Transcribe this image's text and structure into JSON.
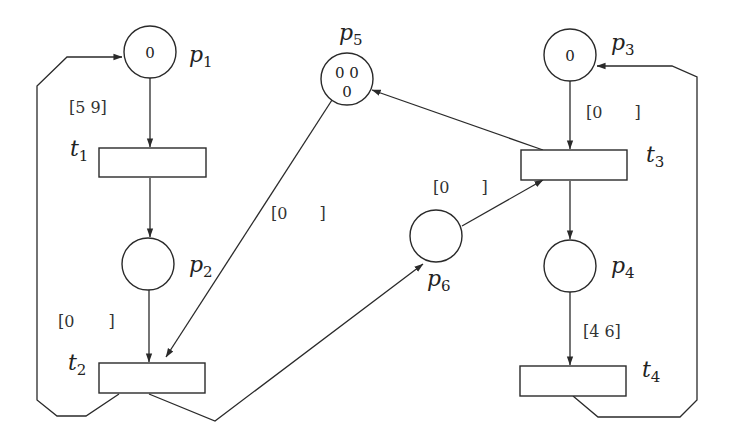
{
  "diagram": {
    "type": "petri-net",
    "places": [
      {
        "id": "p1",
        "label": "p",
        "sub": "1",
        "tokens": [
          "0"
        ]
      },
      {
        "id": "p2",
        "label": "p",
        "sub": "2",
        "tokens": []
      },
      {
        "id": "p3",
        "label": "p",
        "sub": "3",
        "tokens": [
          "0"
        ]
      },
      {
        "id": "p4",
        "label": "p",
        "sub": "4",
        "tokens": []
      },
      {
        "id": "p5",
        "label": "p",
        "sub": "5",
        "tokens": [
          "0 0",
          "0"
        ]
      },
      {
        "id": "p6",
        "label": "p",
        "sub": "6",
        "tokens": []
      }
    ],
    "transitions": [
      {
        "id": "t1",
        "label": "t",
        "sub": "1",
        "interval": {
          "open": "[5",
          "close": "9]"
        }
      },
      {
        "id": "t2",
        "label": "t",
        "sub": "2",
        "interval": {
          "open": "[0",
          "close": "]"
        }
      },
      {
        "id": "t3",
        "label": "t",
        "sub": "3",
        "interval": {
          "open": "[0",
          "close": "]"
        }
      },
      {
        "id": "t4",
        "label": "t",
        "sub": "4",
        "interval": {
          "open": "[4",
          "close": "6]"
        }
      }
    ],
    "arc_intervals": [
      {
        "id": "p5-t2",
        "open": "[0",
        "close": "]"
      },
      {
        "id": "p6-t3",
        "open": "[0",
        "close": "]"
      }
    ],
    "arcs": [
      {
        "from": "p1",
        "to": "t1"
      },
      {
        "from": "t1",
        "to": "p2"
      },
      {
        "from": "p2",
        "to": "t2"
      },
      {
        "from": "t2",
        "to": "p1"
      },
      {
        "from": "p5",
        "to": "t2"
      },
      {
        "from": "t2",
        "to": "p6"
      },
      {
        "from": "p6",
        "to": "t3"
      },
      {
        "from": "p3",
        "to": "t3"
      },
      {
        "from": "t3",
        "to": "p5"
      },
      {
        "from": "t3",
        "to": "p4"
      },
      {
        "from": "p4",
        "to": "t4"
      },
      {
        "from": "t4",
        "to": "p3"
      }
    ]
  }
}
